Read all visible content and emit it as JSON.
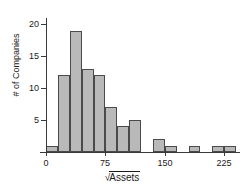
{
  "chart_data": {
    "type": "bar",
    "title": "",
    "xlabel": "√Assets",
    "ylabel": "# of Companies",
    "bin_width": 15,
    "bin_starts": [
      0,
      15,
      30,
      45,
      60,
      75,
      90,
      105,
      120,
      135,
      150,
      165,
      180,
      195,
      210,
      225
    ],
    "categories": [
      "0-15",
      "15-30",
      "30-45",
      "45-60",
      "60-75",
      "75-90",
      "90-105",
      "105-120",
      "120-135",
      "135-150",
      "150-165",
      "165-180",
      "180-195",
      "195-210",
      "210-225",
      "225-240"
    ],
    "values": [
      1,
      12,
      19,
      13,
      12,
      7,
      4,
      5,
      0,
      2,
      1,
      0,
      1,
      0,
      1,
      1
    ],
    "xlim": [
      0,
      240
    ],
    "ylim": [
      0,
      21
    ],
    "xticks": [
      0,
      75,
      150,
      225
    ],
    "xtick_labels": [
      "0",
      "75",
      "150",
      "225"
    ],
    "yticks": [
      5,
      10,
      15,
      20
    ],
    "ytick_labels": [
      "5",
      "10",
      "15",
      "20"
    ],
    "grid": false,
    "legend": null,
    "bar_color": "#b9b9b9",
    "bar_edge_color": "#4a4a4a",
    "axis_color": "#3a3a3a"
  },
  "axis_titles": {
    "y": "# of Companies",
    "x_radical": "√",
    "x_radicand": "Assets"
  }
}
